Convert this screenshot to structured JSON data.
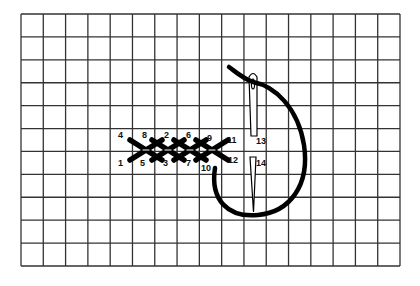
{
  "diagram": {
    "type": "herringbone-stitch-instruction",
    "grid": {
      "left": 21,
      "top": 14,
      "right": 400,
      "bottom": 266,
      "columns": 17,
      "rows": 11,
      "line_color": "#333333"
    },
    "stitch_labels": [
      {
        "text": "4",
        "x": 118,
        "y": 138
      },
      {
        "text": "8",
        "x": 142,
        "y": 138
      },
      {
        "text": "2",
        "x": 164,
        "y": 138
      },
      {
        "text": "6",
        "x": 186,
        "y": 138
      },
      {
        "text": "9",
        "x": 207,
        "y": 141
      },
      {
        "text": "11",
        "x": 227,
        "y": 143
      },
      {
        "text": "1",
        "x": 118,
        "y": 166
      },
      {
        "text": "5",
        "x": 140,
        "y": 166
      },
      {
        "text": "3",
        "x": 163,
        "y": 166
      },
      {
        "text": "7",
        "x": 186,
        "y": 166
      },
      {
        "text": "10",
        "x": 201,
        "y": 171
      },
      {
        "text": "12",
        "x": 228,
        "y": 163
      },
      {
        "text": "13",
        "x": 256,
        "y": 144
      },
      {
        "text": "14",
        "x": 256,
        "y": 166
      }
    ],
    "needle": {
      "label_top": "13",
      "label_bottom": "14"
    },
    "thread_color": "#000000"
  }
}
